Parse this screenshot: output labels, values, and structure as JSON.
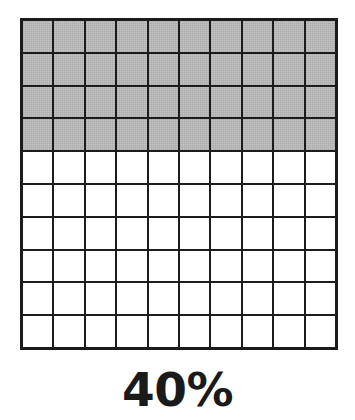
{
  "figure": {
    "title": "",
    "caption": "40%",
    "colors": {
      "shaded_fill": "#bcbcbc",
      "empty_fill": "#ffffff",
      "grid_line": "#1c1c1c",
      "caption_color": "#1a1a1a",
      "background": "#ffffff"
    }
  },
  "chart_data": {
    "type": "heatmap",
    "title": "40%",
    "subtitle": "",
    "xlabel": "",
    "ylabel": "",
    "grid": true,
    "legend": "none",
    "rows": 10,
    "columns": 10,
    "total_cells": 100,
    "shaded_cells": 40,
    "unshaded_cells": 60,
    "percent_value": 40,
    "percent_label": "40%",
    "fill_order": "row-major-from-top",
    "categories": [
      "row 1",
      "row 2",
      "row 3",
      "row 4",
      "row 5",
      "row 6",
      "row 7",
      "row 8",
      "row 9",
      "row 10"
    ],
    "values": [
      10,
      10,
      10,
      10,
      0,
      0,
      0,
      0,
      0,
      0
    ],
    "cell_states": [
      [
        "shaded",
        "shaded",
        "shaded",
        "shaded",
        "shaded",
        "shaded",
        "shaded",
        "shaded",
        "shaded",
        "shaded"
      ],
      [
        "shaded",
        "shaded",
        "shaded",
        "shaded",
        "shaded",
        "shaded",
        "shaded",
        "shaded",
        "shaded",
        "shaded"
      ],
      [
        "shaded",
        "shaded",
        "shaded",
        "shaded",
        "shaded",
        "shaded",
        "shaded",
        "shaded",
        "shaded",
        "shaded"
      ],
      [
        "shaded",
        "shaded",
        "shaded",
        "shaded",
        "shaded",
        "shaded",
        "shaded",
        "shaded",
        "shaded",
        "shaded"
      ],
      [
        "empty",
        "empty",
        "empty",
        "empty",
        "empty",
        "empty",
        "empty",
        "empty",
        "empty",
        "empty"
      ],
      [
        "empty",
        "empty",
        "empty",
        "empty",
        "empty",
        "empty",
        "empty",
        "empty",
        "empty",
        "empty"
      ],
      [
        "empty",
        "empty",
        "empty",
        "empty",
        "empty",
        "empty",
        "empty",
        "empty",
        "empty",
        "empty"
      ],
      [
        "empty",
        "empty",
        "empty",
        "empty",
        "empty",
        "empty",
        "empty",
        "empty",
        "empty",
        "empty"
      ],
      [
        "empty",
        "empty",
        "empty",
        "empty",
        "empty",
        "empty",
        "empty",
        "empty",
        "empty",
        "empty"
      ],
      [
        "empty",
        "empty",
        "empty",
        "empty",
        "empty",
        "empty",
        "empty",
        "empty",
        "empty",
        "empty"
      ]
    ]
  }
}
